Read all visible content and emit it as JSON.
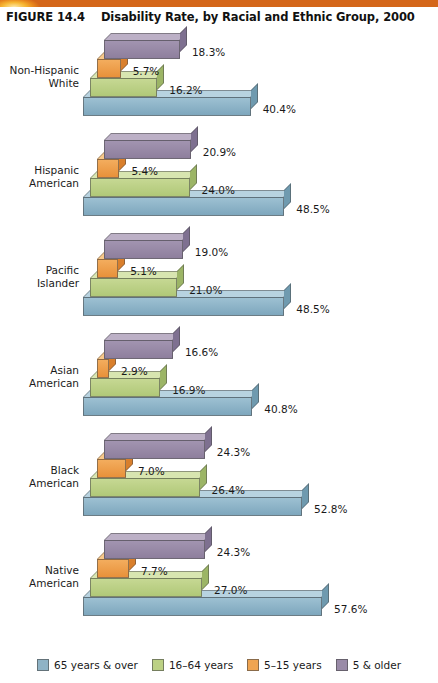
{
  "figure": {
    "number": "FIGURE 14.4",
    "title": "Disability Rate, by Racial and Ethnic Group, 2000"
  },
  "legend": [
    {
      "label": "65 years & over",
      "color": "#8fb3c6"
    },
    {
      "label": "16–64 years",
      "color": "#bcd184"
    },
    {
      "label": "5–15 years",
      "color": "#efa451"
    },
    {
      "label": "5 & older",
      "color": "#9a8ba8"
    }
  ],
  "chart_data": {
    "type": "bar",
    "orientation": "horizontal",
    "title": "Disability Rate, by Racial and Ethnic Group, 2000",
    "xlabel": "",
    "ylabel": "",
    "xlim": [
      0,
      60
    ],
    "grid": false,
    "legend_position": "bottom",
    "value_suffix": "%",
    "categories": [
      "Non-Hispanic White",
      "Hispanic American",
      "Pacific Islander",
      "Asian American",
      "Black American",
      "Native American"
    ],
    "series": [
      {
        "name": "5 & older",
        "color": "#9a8ba8",
        "values": [
          18.3,
          20.9,
          19.0,
          16.6,
          24.3,
          24.3
        ]
      },
      {
        "name": "5–15 years",
        "color": "#efa451",
        "values": [
          5.7,
          5.4,
          5.1,
          2.9,
          7.0,
          7.7
        ]
      },
      {
        "name": "16–64 years",
        "color": "#bcd184",
        "values": [
          16.2,
          24.0,
          21.0,
          16.9,
          26.4,
          27.0
        ]
      },
      {
        "name": "65 years & over",
        "color": "#8fb3c6",
        "values": [
          40.4,
          48.5,
          48.5,
          40.8,
          52.8,
          57.6
        ]
      }
    ]
  },
  "groups": [
    {
      "label_line1": "Non-Hispanic",
      "label_line2": "White",
      "bars": [
        {
          "series": "5 & older",
          "value": 18.3,
          "value_label": "18.3%"
        },
        {
          "series": "5–15 years",
          "value": 5.7,
          "value_label": "5.7%"
        },
        {
          "series": "16–64 years",
          "value": 16.2,
          "value_label": "16.2%"
        },
        {
          "series": "65 years & over",
          "value": 40.4,
          "value_label": "40.4%"
        }
      ]
    },
    {
      "label_line1": "Hispanic",
      "label_line2": "American",
      "bars": [
        {
          "series": "5 & older",
          "value": 20.9,
          "value_label": "20.9%"
        },
        {
          "series": "5–15 years",
          "value": 5.4,
          "value_label": "5.4%"
        },
        {
          "series": "16–64 years",
          "value": 24.0,
          "value_label": "24.0%"
        },
        {
          "series": "65 years & over",
          "value": 48.5,
          "value_label": "48.5%"
        }
      ]
    },
    {
      "label_line1": "Pacific",
      "label_line2": "Islander",
      "bars": [
        {
          "series": "5 & older",
          "value": 19.0,
          "value_label": "19.0%"
        },
        {
          "series": "5–15 years",
          "value": 5.1,
          "value_label": "5.1%"
        },
        {
          "series": "16–64 years",
          "value": 21.0,
          "value_label": "21.0%"
        },
        {
          "series": "65 years & over",
          "value": 48.5,
          "value_label": "48.5%"
        }
      ]
    },
    {
      "label_line1": "Asian",
      "label_line2": "American",
      "bars": [
        {
          "series": "5 & older",
          "value": 16.6,
          "value_label": "16.6%"
        },
        {
          "series": "5–15 years",
          "value": 2.9,
          "value_label": "2.9%"
        },
        {
          "series": "16–64 years",
          "value": 16.9,
          "value_label": "16.9%"
        },
        {
          "series": "65 years & over",
          "value": 40.8,
          "value_label": "40.8%"
        }
      ]
    },
    {
      "label_line1": "Black",
      "label_line2": "American",
      "bars": [
        {
          "series": "5 & older",
          "value": 24.3,
          "value_label": "24.3%"
        },
        {
          "series": "5–15 years",
          "value": 7.0,
          "value_label": "7.0%"
        },
        {
          "series": "16–64 years",
          "value": 26.4,
          "value_label": "26.4%"
        },
        {
          "series": "65 years & over",
          "value": 52.8,
          "value_label": "52.8%"
        }
      ]
    },
    {
      "label_line1": "Native",
      "label_line2": "American",
      "bars": [
        {
          "series": "5 & older",
          "value": 24.3,
          "value_label": "24.3%"
        },
        {
          "series": "5–15 years",
          "value": 7.7,
          "value_label": "7.7%"
        },
        {
          "series": "16–64 years",
          "value": 27.0,
          "value_label": "27.0%"
        },
        {
          "series": "65 years & over",
          "value": 57.6,
          "value_label": "57.6%"
        }
      ]
    }
  ]
}
